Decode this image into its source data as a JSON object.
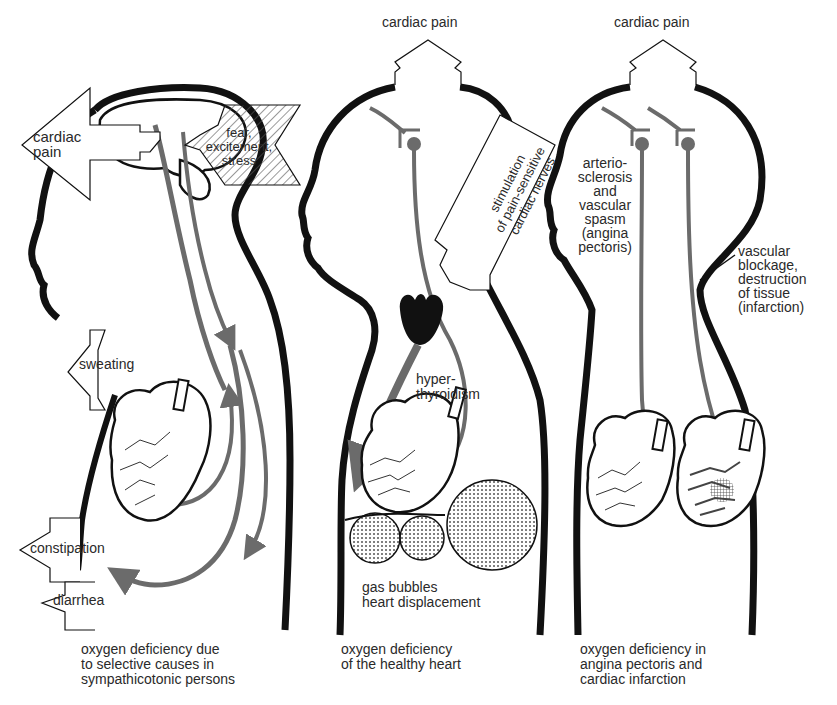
{
  "diagram": {
    "panels": [
      {
        "id": "sympathicotonic",
        "caption": "oxygen deficiency due\nto selective causes in\nsympathicotonic persons",
        "labels": {
          "cardiac_pain": "cardiac\npain",
          "trigger": "fear,\nexcitement,\nstress",
          "sweating": "sweating",
          "constipation": "constipation",
          "diarrhea": "diarrhea"
        }
      },
      {
        "id": "healthy-heart",
        "caption": "oxygen deficiency\nof the healthy heart",
        "labels": {
          "cardiac_pain": "cardiac pain",
          "stimulation": "stimulation\nof pain-sensitive\ncardiac nerves",
          "hyperthyroidism": "hyper-\nthyroidism",
          "gas_bubbles": "gas bubbles\nheart displacement"
        }
      },
      {
        "id": "angina-infarction",
        "caption": "oxygen deficiency in\nangina pectoris and\ncardiac infarction",
        "labels": {
          "cardiac_pain": "cardiac pain",
          "arteriosclerosis": "arterio-\nsclerosis\nand\nvascular\nspasm\n(angina\npectoris)",
          "blockage": "vascular\nblockage,\ndestruction\nof tissue\n(infarction)"
        }
      }
    ],
    "colors": {
      "outline": "#111111",
      "nerve": "#6b6b6b",
      "background": "#ffffff"
    }
  }
}
